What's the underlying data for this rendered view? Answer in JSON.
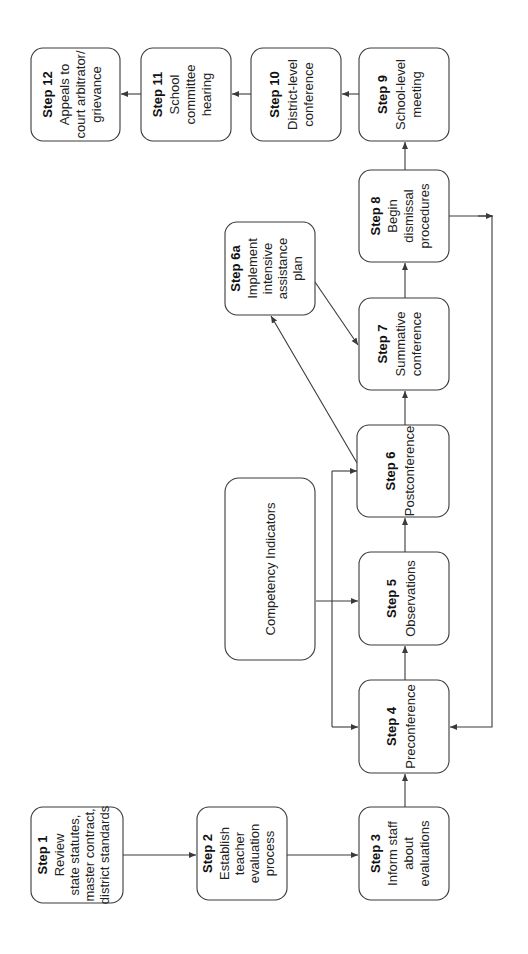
{
  "diagram": {
    "orientation": "rotated 90 degrees counter-clockwise",
    "colors": {
      "stroke": "#3a3a3a",
      "background": "#ffffff",
      "text": "#111111"
    },
    "nodes": {
      "step1": {
        "title": "Step 1",
        "lines": [
          "Review",
          "state statutes,",
          "master contract,",
          "district standards"
        ]
      },
      "step2": {
        "title": "Step 2",
        "lines": [
          "Establish",
          "teacher",
          "evaluation",
          "process"
        ]
      },
      "step3": {
        "title": "Step 3",
        "lines": [
          "Inform staff",
          "about",
          "evaluations"
        ]
      },
      "step4": {
        "title": "Step 4",
        "lines": [
          "Preconference"
        ]
      },
      "step5": {
        "title": "Step 5",
        "lines": [
          "Observations"
        ]
      },
      "step6": {
        "title": "Step 6",
        "lines": [
          "Postconference"
        ]
      },
      "step6a": {
        "title": "Step 6a",
        "lines": [
          "Implement",
          "intensive",
          "assistance",
          "plan"
        ]
      },
      "step7": {
        "title": "Step 7",
        "lines": [
          "Summative",
          "conference"
        ]
      },
      "step8": {
        "title": "Step 8",
        "lines": [
          "Begin",
          "dismissal",
          "procedures"
        ]
      },
      "step9": {
        "title": "Step 9",
        "lines": [
          "School-level",
          "meeting"
        ]
      },
      "step10": {
        "title": "Step 10",
        "lines": [
          "District-level",
          "conference"
        ]
      },
      "step11": {
        "title": "Step 11",
        "lines": [
          "School",
          "committee",
          "hearing"
        ]
      },
      "step12": {
        "title": "Step 12",
        "lines": [
          "Appeals to",
          "court arbitrator/",
          "grievance"
        ]
      },
      "competency": {
        "title": "",
        "lines": [
          "Competency Indicators"
        ]
      }
    },
    "edges": [
      [
        "step1",
        "step2"
      ],
      [
        "step2",
        "step3"
      ],
      [
        "step3",
        "step4"
      ],
      [
        "step4",
        "step5"
      ],
      [
        "step5",
        "step6"
      ],
      [
        "step6",
        "step7"
      ],
      [
        "step6",
        "step6a"
      ],
      [
        "step6a",
        "step7"
      ],
      [
        "step7",
        "step8"
      ],
      [
        "step8",
        "step9"
      ],
      [
        "step8",
        "step4"
      ],
      [
        "step9",
        "step10"
      ],
      [
        "step10",
        "step11"
      ],
      [
        "step11",
        "step12"
      ],
      [
        "competency",
        "step4"
      ],
      [
        "competency",
        "step5"
      ],
      [
        "competency",
        "step6"
      ]
    ]
  }
}
